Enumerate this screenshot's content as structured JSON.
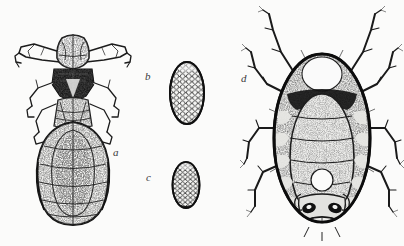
{
  "plate": {
    "kind": "scientific-illustration-plate",
    "medium": "halftone engraving",
    "background_color": "#fbfbfa",
    "ink_color": "#1a1a1a",
    "width": 404,
    "height": 246,
    "figure_count": 4
  },
  "figures": [
    {
      "id": "a",
      "label": "a",
      "label_x": 113,
      "label_y": 147,
      "subject": "louse-nymph-dorsal",
      "description": "dorsal view of a louse-like insect with broad head, forward-projecting mouthparts, dark thorax, six legs and a large oval granulate abdomen",
      "bbox": [
        20,
        25,
        110,
        200
      ]
    },
    {
      "id": "b",
      "label": "b",
      "label_x": 145,
      "label_y": 71,
      "subject": "egg-large-reticulate",
      "description": "large ovoid egg with hexagonal reticulate chorion sculpturing",
      "bbox": [
        168,
        62,
        40,
        62
      ]
    },
    {
      "id": "c",
      "label": "c",
      "label_x": 146,
      "label_y": 172,
      "subject": "egg-small-reticulate",
      "description": "smaller ovoid egg with hexagonal reticulate chorion sculpturing",
      "bbox": [
        170,
        162,
        32,
        46
      ]
    },
    {
      "id": "d",
      "label": "d",
      "label_x": 241,
      "label_y": 73,
      "subject": "mite-dorsal",
      "description": "dorsal view of a mite with large oval segmented idiosoma, pale median patches and eight long annulate legs",
      "bbox": [
        245,
        10,
        155,
        230
      ]
    }
  ]
}
